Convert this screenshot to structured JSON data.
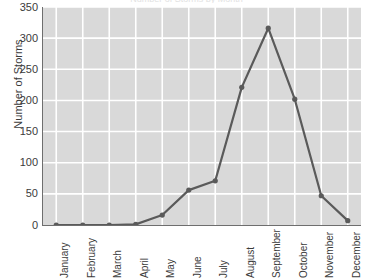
{
  "chart_data": {
    "type": "line",
    "title": "Number of Storms by Month",
    "xlabel": "",
    "ylabel": "Number of Storms",
    "categories": [
      "January",
      "February",
      "March",
      "April",
      "May",
      "June",
      "July",
      "August",
      "September",
      "October",
      "November",
      "December"
    ],
    "values": [
      0,
      0,
      0,
      1,
      16,
      56,
      71,
      221,
      316,
      202,
      47,
      7
    ],
    "ylim": [
      0,
      350
    ],
    "ytick_labels": [
      "0",
      "50",
      "100",
      "150",
      "200",
      "250",
      "300",
      "350"
    ],
    "ytick_values": [
      0,
      50,
      100,
      150,
      200,
      250,
      300,
      350
    ],
    "grid": true,
    "legend": "none",
    "series": [
      {
        "name": "Number of Storms",
        "values": [
          0,
          0,
          0,
          1,
          16,
          56,
          71,
          221,
          316,
          202,
          47,
          7
        ]
      }
    ],
    "colors": {
      "line": "#5a5a5a",
      "marker": "#5a5a5a",
      "plot_background": "#d9d9d9",
      "gridline": "#ffffff",
      "axis": "#6e6e6e",
      "text": "#3b3b3b"
    }
  }
}
